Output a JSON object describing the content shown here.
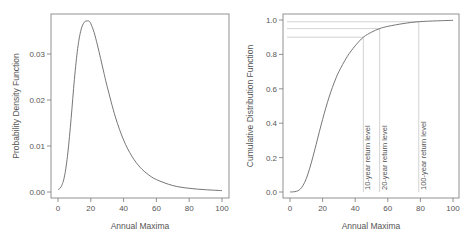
{
  "chart_data": [
    {
      "type": "line",
      "title": "",
      "xlabel": "Annual Maxima",
      "ylabel": "Probability Density Function",
      "xlim": [
        0,
        100
      ],
      "ylim": [
        0,
        0.038
      ],
      "xticks": [
        "0",
        "20",
        "40",
        "60",
        "80",
        "100"
      ],
      "yticks": [
        "0.00",
        "0.01",
        "0.02",
        "0.03"
      ],
      "grid": false,
      "series": [
        {
          "name": "PDF",
          "x": [
            0,
            2,
            4,
            6,
            8,
            10,
            12,
            14,
            16,
            18,
            19,
            20,
            22,
            24,
            26,
            28,
            30,
            35,
            40,
            45,
            50,
            55,
            60,
            70,
            80,
            90,
            100
          ],
          "values": [
            0.0005,
            0.0012,
            0.0035,
            0.0085,
            0.016,
            0.0245,
            0.0312,
            0.0352,
            0.0369,
            0.0372,
            0.0371,
            0.0366,
            0.0347,
            0.032,
            0.029,
            0.0259,
            0.0229,
            0.0163,
            0.0113,
            0.0078,
            0.0054,
            0.0038,
            0.0027,
            0.0014,
            0.0008,
            0.0005,
            0.0003
          ]
        }
      ]
    },
    {
      "type": "line",
      "title": "",
      "xlabel": "Annual Maxima",
      "ylabel": "Cumulative Distribution Function",
      "xlim": [
        0,
        100
      ],
      "ylim": [
        0,
        1.0
      ],
      "xticks": [
        "0",
        "20",
        "40",
        "60",
        "80",
        "100"
      ],
      "yticks": [
        "0.0",
        "0.2",
        "0.4",
        "0.6",
        "0.8",
        "1.0"
      ],
      "grid": false,
      "series": [
        {
          "name": "CDF",
          "x": [
            0,
            2,
            4,
            6,
            8,
            10,
            12,
            14,
            16,
            18,
            20,
            22,
            24,
            26,
            28,
            30,
            35,
            40,
            45,
            50,
            55,
            60,
            70,
            79,
            90,
            100
          ],
          "values": [
            0.0,
            0.001,
            0.004,
            0.014,
            0.038,
            0.078,
            0.135,
            0.202,
            0.275,
            0.35,
            0.422,
            0.49,
            0.552,
            0.608,
            0.657,
            0.7,
            0.786,
            0.85,
            0.9,
            0.929,
            0.95,
            0.963,
            0.98,
            0.99,
            0.995,
            0.998
          ]
        }
      ],
      "annotations": [
        {
          "label": "10-year return level",
          "x": 45,
          "y": 0.9
        },
        {
          "label": "20-year return level",
          "x": 55,
          "y": 0.95
        },
        {
          "label": "100-year return level",
          "x": 79,
          "y": 0.99
        }
      ]
    }
  ],
  "colors": {
    "curve": "#666666",
    "axis": "#777777",
    "guide": "#c8c8c8",
    "text": "#555555"
  }
}
